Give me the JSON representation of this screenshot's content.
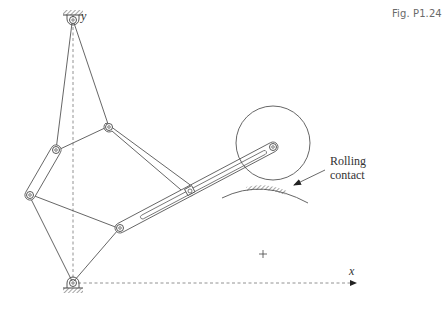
{
  "figure": {
    "label": "Fig. P1.24"
  },
  "axes": {
    "x_label": "x",
    "y_label": "y"
  },
  "annotations": {
    "rolling_contact_line1": "Rolling",
    "rolling_contact_line2": "contact"
  },
  "colors": {
    "line": "#555555",
    "dashed": "#666666",
    "text": "#333333",
    "hatch": "#777777"
  },
  "components": {
    "ground_pivots": [
      "top pivot on y-axis",
      "bottom pivot at origin"
    ],
    "links": [
      "upper-left link",
      "coupler",
      "left binary link",
      "long slotted link",
      "rolling wheel"
    ],
    "center_mark": "+"
  }
}
